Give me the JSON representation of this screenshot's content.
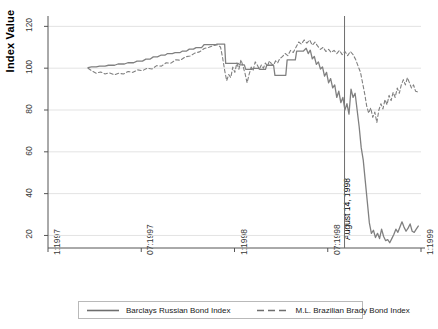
{
  "chart_data": {
    "type": "line",
    "title": "",
    "xlabel": "",
    "ylabel": "Index Value",
    "ylim": [
      14,
      124
    ],
    "yticks": [
      20,
      40,
      60,
      80,
      100,
      120
    ],
    "ytick_labels": [
      "20",
      "40",
      "60",
      "80",
      "100",
      "120"
    ],
    "xlim": [
      "1:1997",
      "1:1999"
    ],
    "xticks": [
      "1:1997",
      "07:1997",
      "1:1998",
      "07:1998",
      "1:1999"
    ],
    "xtick_labels": [
      "1:1997",
      "07:1997",
      "1:1998",
      "07:1998",
      "1:1999"
    ],
    "grid": true,
    "grid_axis": "y",
    "legend_position": "bottom",
    "annotations": [
      {
        "name": "august-14-1998-marker",
        "label": "August 14, 1998",
        "type": "vertical-line",
        "x": "1998-08-14",
        "x_fraction": 0.795
      }
    ],
    "series": [
      {
        "name": "Barclays Russian Bond Index",
        "style": "solid",
        "color": "#808080",
        "points": [
          [
            0.118,
            100.3
          ],
          [
            0.128,
            100.6
          ],
          [
            0.142,
            100.6
          ],
          [
            0.152,
            101.0
          ],
          [
            0.168,
            101.0
          ],
          [
            0.178,
            101.4
          ],
          [
            0.196,
            101.4
          ],
          [
            0.206,
            102.0
          ],
          [
            0.225,
            102.0
          ],
          [
            0.235,
            102.6
          ],
          [
            0.252,
            102.6
          ],
          [
            0.262,
            103.4
          ],
          [
            0.278,
            103.4
          ],
          [
            0.288,
            104.3
          ],
          [
            0.3,
            104.3
          ],
          [
            0.31,
            105.4
          ],
          [
            0.322,
            105.4
          ],
          [
            0.332,
            106.2
          ],
          [
            0.344,
            106.2
          ],
          [
            0.352,
            107.0
          ],
          [
            0.366,
            107.0
          ],
          [
            0.374,
            107.4
          ],
          [
            0.388,
            107.4
          ],
          [
            0.396,
            108.2
          ],
          [
            0.408,
            108.2
          ],
          [
            0.416,
            109.1
          ],
          [
            0.428,
            109.1
          ],
          [
            0.436,
            109.8
          ],
          [
            0.452,
            109.8
          ],
          [
            0.46,
            111.3
          ],
          [
            0.494,
            111.3
          ],
          [
            0.498,
            111.5
          ],
          [
            0.52,
            111.5
          ],
          [
            0.523,
            102.3
          ],
          [
            0.56,
            102.3
          ],
          [
            0.564,
            101.6
          ],
          [
            0.578,
            101.6
          ],
          [
            0.582,
            99.4
          ],
          [
            0.6,
            99.4
          ],
          [
            0.604,
            99.9
          ],
          [
            0.62,
            99.9
          ],
          [
            0.624,
            99.4
          ],
          [
            0.64,
            99.4
          ],
          [
            0.644,
            101.4
          ],
          [
            0.664,
            101.4
          ],
          [
            0.668,
            96.6
          ],
          [
            0.7,
            96.6
          ],
          [
            0.704,
            104.0
          ],
          [
            0.728,
            104.0
          ],
          [
            0.732,
            108.2
          ],
          [
            0.752,
            108.2
          ],
          [
            0.76,
            109.5
          ],
          [
            0.766,
            107.0
          ],
          [
            0.772,
            108.6
          ],
          [
            0.778,
            104.5
          ],
          [
            0.784,
            105.6
          ],
          [
            0.79,
            101.8
          ],
          [
            0.796,
            103.0
          ],
          [
            0.802,
            99.6
          ],
          [
            0.808,
            100.6
          ],
          [
            0.814,
            96.2
          ],
          [
            0.82,
            98.0
          ],
          [
            0.826,
            93.0
          ],
          [
            0.832,
            95.0
          ],
          [
            0.838,
            90.6
          ],
          [
            0.844,
            92.0
          ],
          [
            0.85,
            86.0
          ],
          [
            0.856,
            89.0
          ],
          [
            0.862,
            83.5
          ],
          [
            0.868,
            86.0
          ],
          [
            0.874,
            80.0
          ],
          [
            0.88,
            83.0
          ],
          [
            0.886,
            78.0
          ],
          [
            0.892,
            90.0
          ],
          [
            0.898,
            86.0
          ],
          [
            0.904,
            88.0
          ],
          [
            0.91,
            80.0
          ],
          [
            0.916,
            72.0
          ],
          [
            0.922,
            62.0
          ],
          [
            0.928,
            56.0
          ],
          [
            0.934,
            46.0
          ],
          [
            0.94,
            36.0
          ],
          [
            0.946,
            26.0
          ],
          [
            0.952,
            21.0
          ],
          [
            0.958,
            22.5
          ],
          [
            0.964,
            19.0
          ],
          [
            0.97,
            21.0
          ],
          [
            0.976,
            18.5
          ],
          [
            0.982,
            23.0
          ],
          [
            0.988,
            19.5
          ],
          [
            0.994,
            17.5
          ],
          [
            1.0,
            18.0
          ],
          [
            1.006,
            16.5
          ],
          [
            1.012,
            18.5
          ],
          [
            1.018,
            20.5
          ],
          [
            1.024,
            23.0
          ],
          [
            1.03,
            21.5
          ],
          [
            1.036,
            24.0
          ],
          [
            1.042,
            26.5
          ],
          [
            1.048,
            24.0
          ],
          [
            1.054,
            22.0
          ],
          [
            1.06,
            23.5
          ],
          [
            1.066,
            25.5
          ],
          [
            1.072,
            22.0
          ],
          [
            1.078,
            21.5
          ],
          [
            1.084,
            23.0
          ],
          [
            1.09,
            24.5
          ]
        ]
      },
      {
        "name": "M.L. Brazilian Brady Bond Index",
        "style": "dashed",
        "color": "#808080",
        "points": [
          [
            0.118,
            100.0
          ],
          [
            0.13,
            98.6
          ],
          [
            0.142,
            97.6
          ],
          [
            0.155,
            98.2
          ],
          [
            0.168,
            97.2
          ],
          [
            0.18,
            97.8
          ],
          [
            0.195,
            96.8
          ],
          [
            0.208,
            97.6
          ],
          [
            0.222,
            97.2
          ],
          [
            0.236,
            98.4
          ],
          [
            0.25,
            98.0
          ],
          [
            0.264,
            99.2
          ],
          [
            0.278,
            98.8
          ],
          [
            0.292,
            100.0
          ],
          [
            0.306,
            99.6
          ],
          [
            0.32,
            101.2
          ],
          [
            0.334,
            101.0
          ],
          [
            0.348,
            102.6
          ],
          [
            0.362,
            102.4
          ],
          [
            0.376,
            104.0
          ],
          [
            0.39,
            103.8
          ],
          [
            0.404,
            105.4
          ],
          [
            0.418,
            105.8
          ],
          [
            0.432,
            107.2
          ],
          [
            0.446,
            107.8
          ],
          [
            0.46,
            109.4
          ],
          [
            0.474,
            110.0
          ],
          [
            0.488,
            110.8
          ],
          [
            0.5,
            111.2
          ],
          [
            0.508,
            110.0
          ],
          [
            0.514,
            105.0
          ],
          [
            0.52,
            99.0
          ],
          [
            0.526,
            94.0
          ],
          [
            0.532,
            97.0
          ],
          [
            0.538,
            95.5
          ],
          [
            0.544,
            100.5
          ],
          [
            0.55,
            98.0
          ],
          [
            0.556,
            102.5
          ],
          [
            0.562,
            99.5
          ],
          [
            0.568,
            104.0
          ],
          [
            0.574,
            101.0
          ],
          [
            0.58,
            97.5
          ],
          [
            0.586,
            93.0
          ],
          [
            0.592,
            97.0
          ],
          [
            0.598,
            100.5
          ],
          [
            0.604,
            99.0
          ],
          [
            0.61,
            103.0
          ],
          [
            0.616,
            101.5
          ],
          [
            0.622,
            99.5
          ],
          [
            0.628,
            101.5
          ],
          [
            0.634,
            100.0
          ],
          [
            0.64,
            102.5
          ],
          [
            0.646,
            101.0
          ],
          [
            0.652,
            103.5
          ],
          [
            0.658,
            102.0
          ],
          [
            0.664,
            101.5
          ],
          [
            0.67,
            103.5
          ],
          [
            0.676,
            102.5
          ],
          [
            0.682,
            104.5
          ],
          [
            0.69,
            105.5
          ],
          [
            0.698,
            107.0
          ],
          [
            0.706,
            106.0
          ],
          [
            0.714,
            108.5
          ],
          [
            0.722,
            107.5
          ],
          [
            0.73,
            110.0
          ],
          [
            0.738,
            112.5
          ],
          [
            0.746,
            111.5
          ],
          [
            0.754,
            113.5
          ],
          [
            0.762,
            112.0
          ],
          [
            0.77,
            113.5
          ],
          [
            0.778,
            111.0
          ],
          [
            0.786,
            112.5
          ],
          [
            0.794,
            110.5
          ],
          [
            0.802,
            109.0
          ],
          [
            0.81,
            110.0
          ],
          [
            0.818,
            108.0
          ],
          [
            0.826,
            109.0
          ],
          [
            0.834,
            107.5
          ],
          [
            0.842,
            108.5
          ],
          [
            0.85,
            107.0
          ],
          [
            0.858,
            108.5
          ],
          [
            0.866,
            106.5
          ],
          [
            0.874,
            108.0
          ],
          [
            0.882,
            106.0
          ],
          [
            0.89,
            108.0
          ],
          [
            0.898,
            106.5
          ],
          [
            0.906,
            104.0
          ],
          [
            0.914,
            100.5
          ],
          [
            0.92,
            98.0
          ],
          [
            0.926,
            93.0
          ],
          [
            0.932,
            88.0
          ],
          [
            0.938,
            82.0
          ],
          [
            0.944,
            78.5
          ],
          [
            0.95,
            81.0
          ],
          [
            0.956,
            76.5
          ],
          [
            0.962,
            79.0
          ],
          [
            0.968,
            74.0
          ],
          [
            0.974,
            80.0
          ],
          [
            0.98,
            83.0
          ],
          [
            0.986,
            80.5
          ],
          [
            0.992,
            85.0
          ],
          [
            0.998,
            82.5
          ],
          [
            1.004,
            87.0
          ],
          [
            1.01,
            84.5
          ],
          [
            1.016,
            88.5
          ],
          [
            1.022,
            86.0
          ],
          [
            1.028,
            90.5
          ],
          [
            1.034,
            88.0
          ],
          [
            1.04,
            92.0
          ],
          [
            1.046,
            94.5
          ],
          [
            1.052,
            92.0
          ],
          [
            1.058,
            95.5
          ],
          [
            1.064,
            93.0
          ],
          [
            1.07,
            90.5
          ],
          [
            1.076,
            92.0
          ],
          [
            1.082,
            89.0
          ],
          [
            1.09,
            88.5
          ]
        ]
      }
    ]
  },
  "axes": {
    "ylabel": "Index Value",
    "ytick_labels": [
      "20",
      "40",
      "60",
      "80",
      "100",
      "120"
    ],
    "xtick_labels": [
      "1:1997",
      "07:1997",
      "1:1998",
      "07:1998",
      "1:1999"
    ]
  },
  "annotation": {
    "label": "August 14, 1998"
  },
  "legend": {
    "items": [
      {
        "label": "Barclays Russian Bond Index",
        "style": "solid"
      },
      {
        "label": "M.L. Brazilian Brady Bond Index",
        "style": "dashed"
      }
    ]
  },
  "colors": {
    "line": "#808080",
    "axis": "#555555",
    "grid": "#e3e3e3",
    "text": "#3a3a3a"
  }
}
